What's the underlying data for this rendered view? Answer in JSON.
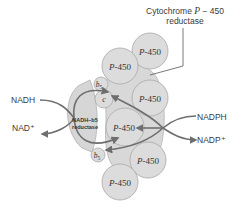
{
  "title_label": {
    "line1_prefix": "Cytochrome ",
    "line1_italic": "P",
    "line1_suffix": " − 450",
    "line2": "reductase"
  },
  "enzymes": {
    "p450": [
      {
        "label_italic": "P",
        "label_rest": "-450"
      },
      {
        "label_italic": "P",
        "label_rest": "-450"
      },
      {
        "label_italic": "P",
        "label_rest": "-450"
      },
      {
        "label_italic": "P",
        "label_rest": "-450"
      },
      {
        "label_italic": "P",
        "label_rest": "-450"
      },
      {
        "label_italic": "P",
        "label_rest": "-450"
      }
    ],
    "b5_top": {
      "label": "b",
      "sub": "5"
    },
    "b5_bottom": {
      "label": "b",
      "sub": "5"
    },
    "cyt_c": {
      "label": "c"
    },
    "nadh_b5_reductase": {
      "line1": "NADH−b5",
      "line2": "reductase"
    }
  },
  "cofactors": {
    "nadh": "NADH",
    "nad_plus": "NAD⁺",
    "nadph": "NADPH",
    "nadp_plus": "NADP⁺"
  },
  "colors": {
    "circle_fill": "#dcdcdc",
    "circle_stroke": "#a8a8a8",
    "membrane_fill": "#d6d6d6",
    "arrow": "#6e6e6e",
    "text": "#3a3a3a"
  }
}
